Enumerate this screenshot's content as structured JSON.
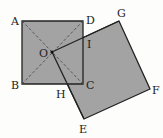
{
  "diagram": {
    "fill_color": "#a3a3a3",
    "stroke_color": "#222222",
    "labels": {
      "A": "A",
      "B": "B",
      "C": "C",
      "D": "D",
      "O": "O",
      "E": "E",
      "F": "F",
      "G": "G",
      "H": "H",
      "I": "I"
    }
  }
}
